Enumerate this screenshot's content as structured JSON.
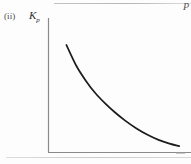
{
  "figure": {
    "part_label": "(ii)",
    "y_axis_label_symbol": "K",
    "y_axis_label_subscript": "p",
    "x_axis_label": "P",
    "curve_color": "#1c1c1c",
    "axis_color": "#8a8a8a",
    "background_color": "#fdfdfd"
  },
  "chart_data": {
    "type": "line",
    "title": "",
    "subtitle": "",
    "xlabel": "P",
    "ylabel": "Kp",
    "grid": false,
    "legend": false,
    "annotations": [
      "(ii)"
    ],
    "axis_style": "L-shaped, no tick marks, no numeric tick labels",
    "xlim": [
      0,
      1
    ],
    "ylim": [
      0,
      1
    ],
    "xticks": [],
    "yticks": [],
    "series": [
      {
        "name": "Kp vs P",
        "x": [
          0.13,
          0.2,
          0.27,
          0.34,
          0.41,
          0.48,
          0.56,
          0.64,
          0.72,
          0.8,
          0.88,
          0.95
        ],
        "y": [
          0.85,
          0.69,
          0.57,
          0.47,
          0.39,
          0.32,
          0.25,
          0.19,
          0.14,
          0.1,
          0.07,
          0.05
        ]
      }
    ]
  }
}
